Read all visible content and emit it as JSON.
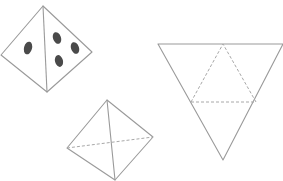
{
  "figure": {
    "colors": {
      "edge": "#9a9a9a",
      "dashed_edge": "#a8a8a8",
      "dot": "#4a4a4a",
      "background": "#ffffff"
    },
    "shapes": [
      {
        "id": "tetrahedron-with-dots",
        "vertices": {
          "top": [
            43,
            6
          ],
          "left": [
            1,
            55
          ],
          "bottom": [
            47,
            92
          ],
          "right": [
            92,
            52
          ]
        },
        "faces": [
          {
            "face": "left",
            "dot_count": 1
          },
          {
            "face": "right",
            "dot_count": 3
          }
        ]
      },
      {
        "id": "tetrahedron-plain",
        "vertices": {
          "top": [
            107,
            100
          ],
          "left": [
            67,
            148
          ],
          "bottom": [
            115,
            180
          ],
          "right": [
            153,
            137
          ]
        },
        "hidden_edge": "left-right (dashed)"
      },
      {
        "id": "tetrahedron-net",
        "outer_triangle": {
          "top_left": [
            158,
            44
          ],
          "top_right": [
            283,
            44
          ],
          "bottom": [
            223,
            160
          ]
        },
        "inner_fold_triangle": {
          "apex": [
            223,
            44
          ],
          "left": [
            191,
            102
          ],
          "right": [
            256,
            102
          ]
        },
        "fold_lines": "dashed"
      }
    ]
  }
}
